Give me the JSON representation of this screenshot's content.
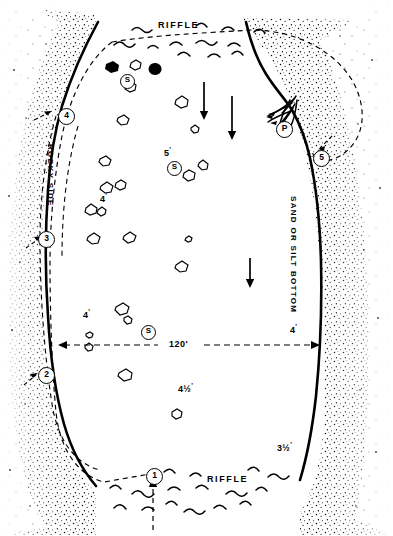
{
  "figure": {
    "type": "illustration",
    "colors": {
      "ink": "#000000",
      "paper": "#ffffff",
      "stipple": "#000000"
    }
  },
  "labels": {
    "riffle_top": "RIFFLE",
    "riffle_bottom": "RIFFLE",
    "rocky_side": "ROCKY SIDE",
    "sand_or_silt_bottom": "SAND OR SILT BOTTOM",
    "dimension_width": "120'"
  },
  "depths": [
    {
      "id": "depth-5ft",
      "text": "5",
      "unit": "'",
      "x": 164,
      "y": 146
    },
    {
      "id": "depth-4ft-left",
      "text": "4",
      "unit": "'",
      "x": 100,
      "y": 192
    },
    {
      "id": "depth-4ft-lower-left",
      "text": "4",
      "unit": "'",
      "x": 83,
      "y": 308
    },
    {
      "id": "depth-4ft-right",
      "text": "4",
      "unit": "'",
      "x": 290,
      "y": 323
    },
    {
      "id": "depth-4-5ft",
      "text": "4",
      "frac": "1/2",
      "unit": "'",
      "x": 178,
      "y": 382
    },
    {
      "id": "depth-3-5ft",
      "text": "3",
      "frac": "1/2",
      "unit": "'",
      "x": 277,
      "y": 441
    }
  ],
  "markers": [
    {
      "id": "marker-1",
      "label": "1",
      "x": 146,
      "y": 468,
      "kind": "position"
    },
    {
      "id": "marker-2",
      "label": "2",
      "x": 38,
      "y": 367,
      "kind": "position"
    },
    {
      "id": "marker-3",
      "label": "3",
      "x": 38,
      "y": 231,
      "kind": "position"
    },
    {
      "id": "marker-4",
      "label": "4",
      "x": 58,
      "y": 108,
      "kind": "position"
    },
    {
      "id": "marker-5",
      "label": "5",
      "x": 313,
      "y": 150,
      "kind": "position"
    },
    {
      "id": "marker-p",
      "label": "P",
      "x": 276,
      "y": 121,
      "kind": "brush-pile"
    },
    {
      "id": "marker-s-top",
      "label": "S",
      "x": 120,
      "y": 74,
      "kind": "structure"
    },
    {
      "id": "marker-s-middle",
      "label": "S",
      "x": 167,
      "y": 161,
      "kind": "structure"
    },
    {
      "id": "marker-s-lower",
      "label": "S",
      "x": 141,
      "y": 325,
      "kind": "structure"
    }
  ],
  "flow_arrows": [
    {
      "id": "flow-arrow-1",
      "x": 204,
      "y": 82,
      "length": 36
    },
    {
      "id": "flow-arrow-2",
      "x": 232,
      "y": 96,
      "length": 42
    },
    {
      "id": "flow-arrow-3",
      "x": 250,
      "y": 258,
      "length": 32
    }
  ],
  "icons": {
    "rock_icon": "rock-icon",
    "boulder_icon": "boulder-icon",
    "arrow_down_icon": "arrow-down-icon",
    "arrow_right_icon": "arrow-right-icon",
    "wave_icon": "wave-icon",
    "brush_pile_icon": "brush-pile-icon",
    "stipple_bank_icon": "stipple-bank-icon"
  }
}
